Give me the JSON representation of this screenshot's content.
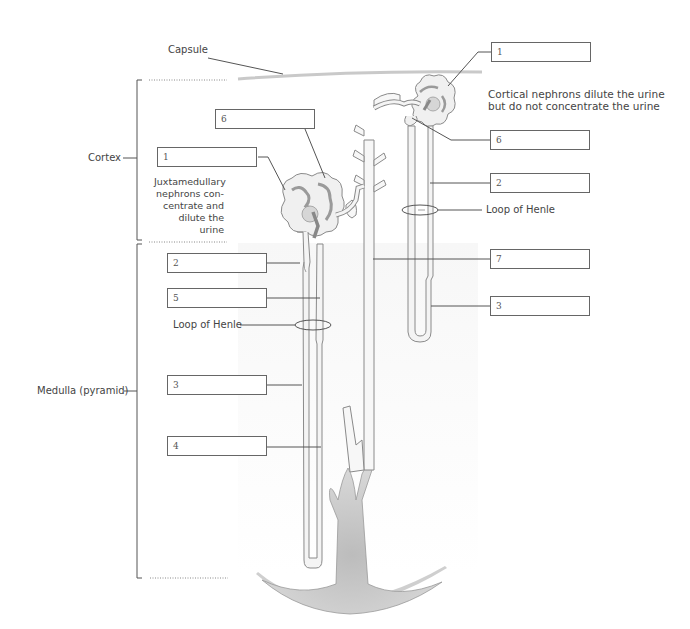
{
  "diagram": {
    "regions": {
      "capsule": "Capsule",
      "cortex": "Cortex",
      "medulla": "Medulla (pyramid)"
    },
    "notes": {
      "cortical": [
        "Cortical nephrons dilute the urine",
        "but do not concentrate the urine"
      ],
      "juxtamedullary": [
        "Juxtamedullary",
        "nephrons con-",
        "centrate and",
        "dilute the urine"
      ]
    },
    "loop_labels": {
      "left": "Loop of Henle",
      "right": "Loop of Henle"
    },
    "label_boxes": {
      "left": [
        {
          "id": "6",
          "x": 215,
          "y": 109
        },
        {
          "id": "1",
          "x": 157,
          "y": 147
        },
        {
          "id": "2",
          "x": 167,
          "y": 253
        },
        {
          "id": "5",
          "x": 167,
          "y": 288
        },
        {
          "id": "3",
          "x": 167,
          "y": 375
        },
        {
          "id": "4",
          "x": 167,
          "y": 436
        }
      ],
      "right": [
        {
          "id": "1",
          "x": 491,
          "y": 42
        },
        {
          "id": "6",
          "x": 490,
          "y": 130
        },
        {
          "id": "2",
          "x": 490,
          "y": 173
        },
        {
          "id": "7",
          "x": 490,
          "y": 249
        },
        {
          "id": "3",
          "x": 490,
          "y": 296
        }
      ]
    },
    "colors": {
      "line": "#555555",
      "tubule_fill": "#f2f2f2",
      "tubule_stroke": "#8a8a8a",
      "glomerulus": "#d8d8d8",
      "medulla_shade": "#f4f4f4",
      "pelvis": "#bdbdbd"
    }
  }
}
